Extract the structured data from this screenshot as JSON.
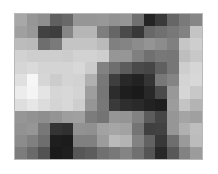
{
  "figure": {
    "type": "grayscale-pixel-image",
    "title": "",
    "caption": "",
    "background_color": "#ffffff",
    "border_color": "#b8b8b8",
    "plot_left_px": 14,
    "plot_top_px": 13,
    "plot_width_px": 189,
    "plot_height_px": 147
  },
  "chart_data": {
    "type": "heatmap",
    "title": "",
    "subtitle": "",
    "xlabel": "",
    "ylabel": "",
    "colormap": "gray",
    "grid": false,
    "legend": "none",
    "colorbar": false,
    "interpolation": "nearest",
    "rows": 12,
    "cols": 16,
    "value_range": [
      0,
      255
    ],
    "xticklabels": [],
    "yticklabels": [],
    "annotations": [],
    "values": [
      [
        168,
        150,
        142,
        96,
        104,
        150,
        150,
        152,
        146,
        150,
        112,
        36,
        58,
        102,
        122,
        134
      ],
      [
        160,
        152,
        66,
        62,
        134,
        182,
        182,
        126,
        102,
        74,
        56,
        104,
        112,
        120,
        130,
        196
      ],
      [
        188,
        186,
        110,
        122,
        196,
        196,
        196,
        186,
        128,
        132,
        140,
        148,
        140,
        128,
        198,
        206
      ],
      [
        210,
        206,
        206,
        206,
        204,
        210,
        210,
        206,
        150,
        150,
        128,
        112,
        120,
        118,
        190,
        200
      ],
      [
        214,
        218,
        212,
        212,
        212,
        216,
        204,
        130,
        110,
        92,
        74,
        70,
        96,
        118,
        206,
        214
      ],
      [
        224,
        246,
        214,
        204,
        212,
        210,
        176,
        120,
        62,
        40,
        34,
        52,
        120,
        132,
        212,
        216
      ],
      [
        236,
        244,
        228,
        214,
        216,
        212,
        158,
        118,
        44,
        30,
        26,
        40,
        74,
        152,
        214,
        200
      ],
      [
        222,
        230,
        220,
        212,
        216,
        206,
        150,
        120,
        58,
        46,
        42,
        34,
        30,
        156,
        196,
        180
      ],
      [
        150,
        146,
        142,
        148,
        158,
        160,
        124,
        116,
        150,
        148,
        130,
        92,
        70,
        150,
        164,
        160
      ],
      [
        146,
        150,
        120,
        52,
        48,
        146,
        144,
        162,
        166,
        162,
        116,
        64,
        66,
        150,
        176,
        190
      ],
      [
        140,
        128,
        110,
        30,
        28,
        128,
        128,
        156,
        186,
        180,
        130,
        98,
        56,
        110,
        154,
        188
      ],
      [
        124,
        106,
        82,
        26,
        30,
        86,
        92,
        112,
        120,
        132,
        112,
        84,
        40,
        88,
        130,
        156
      ]
    ]
  }
}
